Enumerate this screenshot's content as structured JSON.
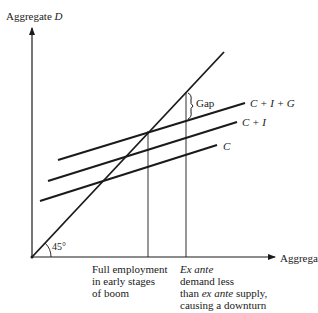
{
  "axes": {
    "y_label_prefix": "Aggregate ",
    "y_label_var": "D",
    "x_label_prefix": "Aggregate ",
    "x_label_var": "S",
    "angle_label": "45°"
  },
  "curves": {
    "cig": "C + I + G",
    "ci": "C + I",
    "c": "C"
  },
  "gap_label": "Gap",
  "annotations": {
    "full_employment": [
      "Full employment",
      "in early stages",
      "of boom"
    ],
    "ex_ante": {
      "line1": "Ex ante",
      "line2": "demand less",
      "line3_prefix": "than ",
      "line3_italic": "ex ante",
      "line3_suffix": " supply,",
      "line4": "causing a downturn"
    }
  }
}
